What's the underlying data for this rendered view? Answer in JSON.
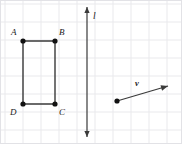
{
  "figure": {
    "type": "geometry-diagram",
    "canvas": {
      "width": 182,
      "height": 144,
      "background": "#ffffff"
    },
    "grid": {
      "visible": true,
      "cell_size": 18,
      "offset_x": 5,
      "offset_y": 4,
      "line_color": "#e9e9ec",
      "border_color": "#e2e2e6"
    },
    "colors": {
      "stroke": "#3a3a3a",
      "point_fill": "#111111",
      "label_text": "#1a1a1a"
    },
    "rectangle": {
      "name": "rectangle-abcd",
      "stroke_width": 1.4,
      "vertices": [
        {
          "id": "A",
          "label": "A",
          "x": 23,
          "y": 41,
          "label_x": 11,
          "label_y": 28
        },
        {
          "id": "B",
          "label": "B",
          "x": 55,
          "y": 41,
          "label_x": 59,
          "label_y": 28
        },
        {
          "id": "C",
          "label": "C",
          "x": 55,
          "y": 104,
          "label_x": 59,
          "label_y": 108
        },
        {
          "id": "D",
          "label": "D",
          "x": 23,
          "y": 104,
          "label_x": 10,
          "label_y": 108
        }
      ],
      "point_radius": 2.6
    },
    "line": {
      "name": "line-l",
      "label": "l",
      "x": 87,
      "y_top": 7,
      "y_bottom": 137,
      "stroke_width": 1.2,
      "double_headed": true,
      "label_x": 93,
      "label_y": 12
    },
    "vector": {
      "name": "vector-v",
      "label": "v",
      "start_x": 117,
      "start_y": 101,
      "end_x": 168,
      "end_y": 86,
      "stroke_width": 1.2,
      "point_radius": 2.6,
      "label_x": 135,
      "label_y": 79
    }
  }
}
